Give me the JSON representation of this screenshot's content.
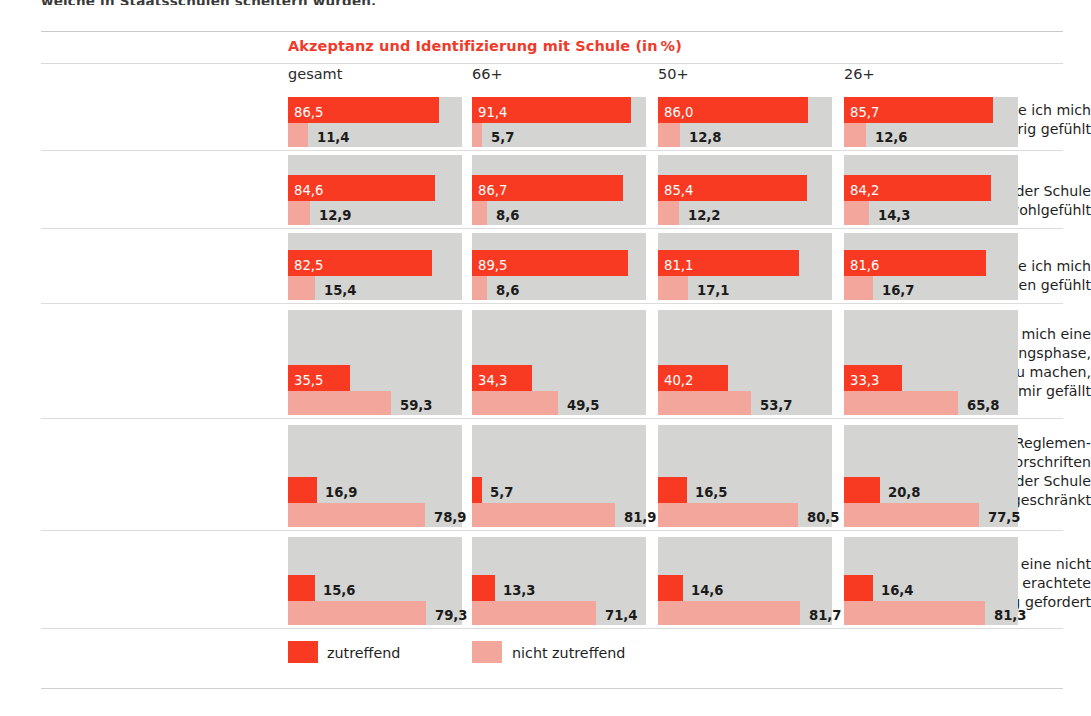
{
  "top_caption": "welche in Staatsschulen scheitern würden.",
  "header": {
    "section_title": "Akzeptanz und Identifizierung mit Schule (in %)",
    "columns": [
      "gesamt",
      "66+",
      "50+",
      "26+"
    ]
  },
  "legend": [
    {
      "key": "zutreffend",
      "label": "zutreffend",
      "color": "#f93a22"
    },
    {
      "key": "nicht",
      "label": "nicht zutreffend",
      "color": "#f3a79c"
    }
  ],
  "chart_data": {
    "type": "bar",
    "xlabel": "",
    "ylabel": "",
    "xlim": [
      0,
      100
    ],
    "grid": false,
    "legend_position": "bottom",
    "group_labels": [
      "gesamt",
      "66+",
      "50+",
      "26+"
    ],
    "series": [
      {
        "name": "zutreffend",
        "color": "#f93a22"
      },
      {
        "name": "nicht zutreffend",
        "color": "#f3a79c"
      }
    ],
    "categories": [
      "In der Schule habe ich mich zugehörig gefühlt",
      "Ich habe mich in der Schule wohlgefühlt",
      "In der Schule habe ich mich geborgen gefühlt",
      "Schule war für mich eine notwendige Durchgangsphase, um danach zu machen, was mir gefällt",
      "Durch zu viele Reglementierungen und Vorschriften fühlte ich mich in der Schule eingeschränkt",
      "Schule hat von mir eine nicht als sinnvoll erachtete Anpassungsleistung gefordert"
    ],
    "rows": [
      {
        "label_lines": [
          "In der Schule habe ich mich",
          "zugehörig gefühlt"
        ],
        "groups": [
          {
            "group": "gesamt",
            "zutreffend": 86.5,
            "nicht": 11.4,
            "zutreffend_text": "86,5",
            "nicht_text": "11,4"
          },
          {
            "group": "66+",
            "zutreffend": 91.4,
            "nicht": 5.7,
            "zutreffend_text": "91,4",
            "nicht_text": "5,7"
          },
          {
            "group": "50+",
            "zutreffend": 86.0,
            "nicht": 12.8,
            "zutreffend_text": "86,0",
            "nicht_text": "12,8"
          },
          {
            "group": "26+",
            "zutreffend": 85.7,
            "nicht": 12.6,
            "zutreffend_text": "85,7",
            "nicht_text": "12,6"
          }
        ]
      },
      {
        "label_lines": [
          "Ich habe mich in der Schule",
          "wohlgefühlt"
        ],
        "groups": [
          {
            "group": "gesamt",
            "zutreffend": 84.6,
            "nicht": 12.9,
            "zutreffend_text": "84,6",
            "nicht_text": "12,9"
          },
          {
            "group": "66+",
            "zutreffend": 86.7,
            "nicht": 8.6,
            "zutreffend_text": "86,7",
            "nicht_text": "8,6"
          },
          {
            "group": "50+",
            "zutreffend": 85.4,
            "nicht": 12.2,
            "zutreffend_text": "85,4",
            "nicht_text": "12,2"
          },
          {
            "group": "26+",
            "zutreffend": 84.2,
            "nicht": 14.3,
            "zutreffend_text": "84,2",
            "nicht_text": "14,3"
          }
        ]
      },
      {
        "label_lines": [
          "In der Schule habe ich mich",
          "geborgen gefühlt"
        ],
        "groups": [
          {
            "group": "gesamt",
            "zutreffend": 82.5,
            "nicht": 15.4,
            "zutreffend_text": "82,5",
            "nicht_text": "15,4"
          },
          {
            "group": "66+",
            "zutreffend": 89.5,
            "nicht": 8.6,
            "zutreffend_text": "89,5",
            "nicht_text": "8,6"
          },
          {
            "group": "50+",
            "zutreffend": 81.1,
            "nicht": 17.1,
            "zutreffend_text": "81,1",
            "nicht_text": "17,1"
          },
          {
            "group": "26+",
            "zutreffend": 81.6,
            "nicht": 16.7,
            "zutreffend_text": "81,6",
            "nicht_text": "16,7"
          }
        ]
      },
      {
        "label_lines": [
          "Schule war für mich eine",
          "notwendige Durchgangsphase,",
          "um danach zu machen,",
          "was mir gefällt"
        ],
        "groups": [
          {
            "group": "gesamt",
            "zutreffend": 35.5,
            "nicht": 59.3,
            "zutreffend_text": "35,5",
            "nicht_text": "59,3"
          },
          {
            "group": "66+",
            "zutreffend": 34.3,
            "nicht": 49.5,
            "zutreffend_text": "34,3",
            "nicht_text": "49,5"
          },
          {
            "group": "50+",
            "zutreffend": 40.2,
            "nicht": 53.7,
            "zutreffend_text": "40,2",
            "nicht_text": "53,7"
          },
          {
            "group": "26+",
            "zutreffend": 33.3,
            "nicht": 65.8,
            "zutreffend_text": "33,3",
            "nicht_text": "65,8"
          }
        ]
      },
      {
        "label_lines": [
          "Durch zu viele Reglemen-",
          "tierungen und Vorschriften",
          "fühlte ich mich in der Schule",
          "eingeschränkt"
        ],
        "groups": [
          {
            "group": "gesamt",
            "zutreffend": 16.9,
            "nicht": 78.9,
            "zutreffend_text": "16,9",
            "nicht_text": "78,9"
          },
          {
            "group": "66+",
            "zutreffend": 5.7,
            "nicht": 81.9,
            "zutreffend_text": "5,7",
            "nicht_text": "81,9"
          },
          {
            "group": "50+",
            "zutreffend": 16.5,
            "nicht": 80.5,
            "zutreffend_text": "16,5",
            "nicht_text": "80,5"
          },
          {
            "group": "26+",
            "zutreffend": 20.8,
            "nicht": 77.5,
            "zutreffend_text": "20,8",
            "nicht_text": "77,5"
          }
        ]
      },
      {
        "label_lines": [
          "Schule hat von mir eine nicht",
          "als sinnvoll erachtete",
          "Anpassungsleistung gefordert"
        ],
        "groups": [
          {
            "group": "gesamt",
            "zutreffend": 15.6,
            "nicht": 79.3,
            "zutreffend_text": "15,6",
            "nicht_text": "79,3"
          },
          {
            "group": "66+",
            "zutreffend": 13.3,
            "nicht": 71.4,
            "zutreffend_text": "13,3",
            "nicht_text": "71,4"
          },
          {
            "group": "50+",
            "zutreffend": 14.6,
            "nicht": 81.7,
            "zutreffend_text": "14,6",
            "nicht_text": "81,7"
          },
          {
            "group": "26+",
            "zutreffend": 16.4,
            "nicht": 81.3,
            "zutreffend_text": "16,4",
            "nicht_text": "81,3"
          }
        ]
      }
    ]
  }
}
